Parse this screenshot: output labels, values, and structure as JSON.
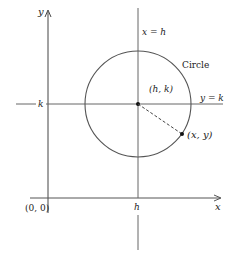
{
  "diagram": {
    "type": "circle-on-coordinate-axes",
    "axes": {
      "x_label": "x",
      "y_label": "y",
      "origin_label": "(0, 0)"
    },
    "lines": {
      "vertical_label": "x = h",
      "horizontal_label": "y = k",
      "h_tick_label": "h",
      "k_tick_label": "k"
    },
    "circle": {
      "label": "Circle",
      "center_label": "(h, k)",
      "point_label": "(x, y)"
    },
    "colors": {
      "line": "#555555",
      "text": "#222222",
      "background": "#ffffff"
    }
  }
}
